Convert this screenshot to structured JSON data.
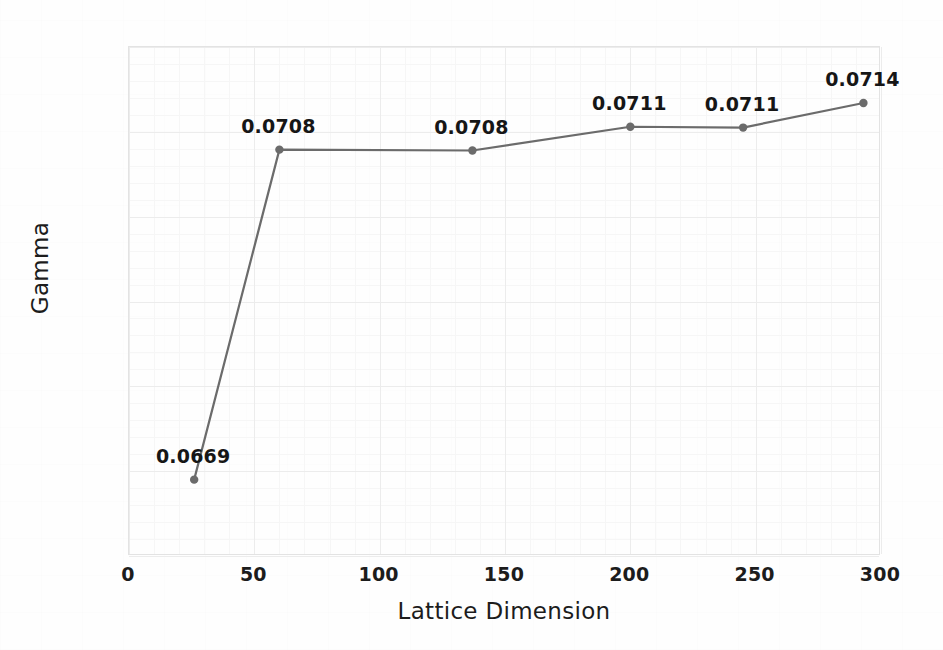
{
  "chart_data": {
    "type": "line",
    "title": "",
    "xlabel": "Lattice Dimension",
    "ylabel": "Gamma",
    "xlim": [
      0,
      300
    ],
    "ylim": [
      0.066,
      0.072
    ],
    "grid": true,
    "legend": "none",
    "xticks": [
      0,
      50,
      100,
      150,
      200,
      250,
      300
    ],
    "xtick_labels": [
      "0",
      "50",
      "100",
      "150",
      "200",
      "250",
      "300"
    ],
    "yticks": [
      0.066,
      0.067,
      0.068,
      0.069,
      0.07,
      0.071,
      0.072
    ],
    "ytick_labels": [
      "0.066",
      "0.067",
      "0.068",
      "0.069",
      "0.07",
      "0.071",
      "0.072"
    ],
    "series": [
      {
        "name": "Gamma",
        "color": "#6b6b6b",
        "marker": "circle",
        "x": [
          26,
          60,
          137,
          200,
          245,
          293
        ],
        "y": [
          0.0669,
          0.07079,
          0.07078,
          0.07106,
          0.07105,
          0.07134
        ],
        "point_labels": [
          "0.0669",
          "0.0708",
          "0.0708",
          "0.0711",
          "0.0711",
          "0.0714"
        ]
      }
    ]
  },
  "style": {
    "line_color": "#6b6b6b",
    "marker_color": "#6b6b6b",
    "text_color": "#1c1c1c",
    "grid_color": "#ececec",
    "minor_grid_color": "#f6f6f6",
    "axis_color": "#e3e3e3",
    "background": "#ffffff"
  }
}
